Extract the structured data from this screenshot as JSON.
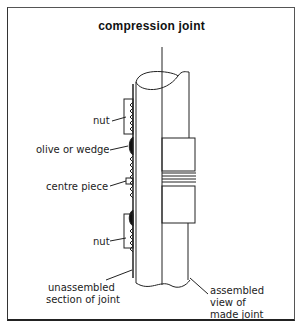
{
  "title": "compression joint",
  "labels": {
    "nut_top": "nut",
    "olive": "olive or wedge",
    "centre": "centre piece",
    "nut_bottom": "nut",
    "unassembled_1": "unassembled",
    "unassembled_2": "section of joint",
    "assembled_1": "assembled",
    "assembled_2": "view of",
    "assembled_3": "made joint"
  }
}
